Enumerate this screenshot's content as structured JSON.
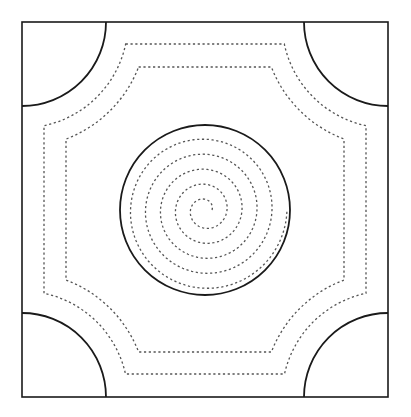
{
  "diagram": {
    "canvas": {
      "width": 411,
      "height": 417,
      "background": "#ffffff"
    },
    "colors": {
      "solid_line": "#1a1a1a",
      "dotted_line": "#555555"
    },
    "frame": {
      "x1": 22,
      "y1": 22,
      "x2": 388,
      "y2": 397
    },
    "corner_arc_radius": 84,
    "dotted_octagons": [
      {
        "name": "outer",
        "x1": 44,
        "y1": 44,
        "x2": 366,
        "y2": 374,
        "corner_radius": 106
      },
      {
        "name": "inner",
        "x1": 66,
        "y1": 67,
        "x2": 344,
        "y2": 352,
        "corner_radius": 125
      }
    ],
    "center_circle": {
      "cx": 205,
      "cy": 210,
      "r": 85
    },
    "spiral": {
      "cx": 205,
      "cy": 210,
      "r_start": 7,
      "r_end": 82,
      "turns": 5,
      "direction": "counterclockwise"
    }
  }
}
